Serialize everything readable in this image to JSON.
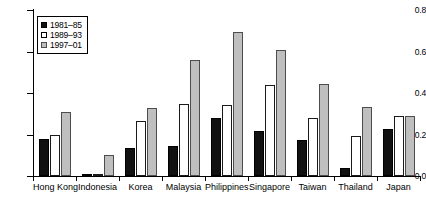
{
  "chart_data": {
    "type": "bar",
    "title": "",
    "subtitle": "",
    "xlabel": "",
    "ylabel": "",
    "ylim": [
      0.0,
      0.8
    ],
    "yticks": [
      "0.0",
      "0.2",
      "0.4",
      "0.6",
      "0.8"
    ],
    "ytick_values": [
      0.0,
      0.2,
      0.4,
      0.6,
      0.8
    ],
    "grid": false,
    "legend_position": "top-left",
    "categories": [
      "Hong Kong",
      "Indonesia",
      "Korea",
      "Malaysia",
      "Philippines",
      "Singapore",
      "Taiwan",
      "Thailand",
      "Japan"
    ],
    "series": [
      {
        "name": "1981–85",
        "color": "#111111",
        "values": [
          0.18,
          0.005,
          0.135,
          0.145,
          0.28,
          0.215,
          0.175,
          0.04,
          0.225
        ]
      },
      {
        "name": "1989–93",
        "color": "#ffffff",
        "values": [
          0.2,
          0.012,
          0.265,
          0.345,
          0.34,
          0.44,
          0.28,
          0.195,
          0.29
        ]
      },
      {
        "name": "1997–01",
        "color": "#bfbfbf",
        "values": [
          0.31,
          0.1,
          0.33,
          0.56,
          0.695,
          0.605,
          0.445,
          0.335,
          0.29
        ]
      }
    ]
  }
}
